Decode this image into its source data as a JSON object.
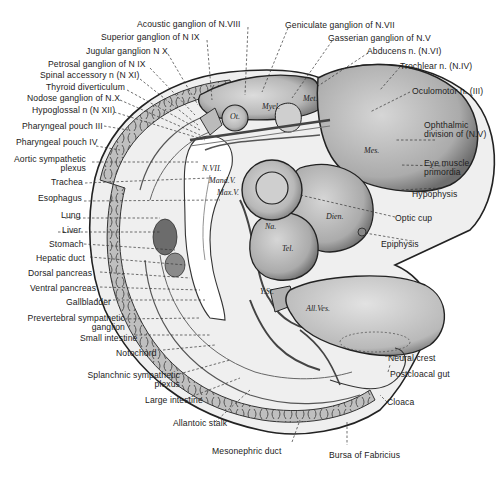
{
  "figure": {
    "colors": {
      "background": "#ffffff",
      "ink": "#1a1a1a",
      "tissue_light": "#e4e4e4",
      "tissue_mid": "#bdbdbd",
      "tissue_dark": "#8a8a8a"
    }
  },
  "labels_top": [
    {
      "id": "acoustic",
      "text": "Acoustic ganglion of N.VIII"
    },
    {
      "id": "superior",
      "text": "Superior ganglion of N IX"
    },
    {
      "id": "jugular",
      "text": "Jugular ganglion N X"
    },
    {
      "id": "geniculate",
      "text": "Geniculate ganglion of N.VII"
    },
    {
      "id": "gasserian",
      "text": "Gasserian ganglion of N.V"
    },
    {
      "id": "abducens",
      "text": "Abducens n. (N.VI)"
    },
    {
      "id": "trochlear",
      "text": "Trochlear n. (N.IV)"
    }
  ],
  "labels_left": [
    {
      "id": "petrosal",
      "text": "Petrosal ganglion of N IX"
    },
    {
      "id": "spinal-accessory",
      "text": "Spinal accessory n (N XI)"
    },
    {
      "id": "thyroid",
      "text": "Thyroid diverticulum"
    },
    {
      "id": "nodose",
      "text": "Nodose ganglion of N.X"
    },
    {
      "id": "hypoglossal",
      "text": "Hypoglossal n (N XII)"
    },
    {
      "id": "pharyngeal-3",
      "text": "Pharyngeal pouch III"
    },
    {
      "id": "pharyngeal-4",
      "text": "Pharyngeal pouch IV"
    },
    {
      "id": "aortic-symp",
      "text": "Aortic sympathetic",
      "text2": "plexus"
    },
    {
      "id": "trachea",
      "text": "Trachea"
    },
    {
      "id": "esophagus",
      "text": "Esophagus"
    },
    {
      "id": "lung",
      "text": "Lung"
    },
    {
      "id": "liver",
      "text": "Liver"
    },
    {
      "id": "stomach",
      "text": "Stomach"
    },
    {
      "id": "hepatic-duct",
      "text": "Hepatic duct"
    },
    {
      "id": "dorsal-pancreas",
      "text": "Dorsal pancreas"
    },
    {
      "id": "ventral-pancreas",
      "text": "Ventral pancreas"
    },
    {
      "id": "gallbladder",
      "text": "Gallbladder"
    },
    {
      "id": "prevertebral",
      "text": "Prevertebral sympathetic",
      "text2": "ganglion"
    },
    {
      "id": "small-intestine",
      "text": "Small intestine"
    },
    {
      "id": "notochord",
      "text": "Notochord"
    },
    {
      "id": "splanchnic",
      "text": "Splanchnic sympathetic",
      "text2": "plexus"
    },
    {
      "id": "large-intestine",
      "text": "Large intestine"
    },
    {
      "id": "allantoic-stalk",
      "text": "Allantoic stalk"
    },
    {
      "id": "mesonephric-duct",
      "text": "Mesonephric duct"
    }
  ],
  "labels_right": [
    {
      "id": "oculomotor",
      "text": "Oculomotor n. (III)"
    },
    {
      "id": "ophthalmic",
      "text": "Ophthalmic",
      "text2": "division of (N.V)"
    },
    {
      "id": "eye-muscle",
      "text": "Eye muscle",
      "text2": "primordia"
    },
    {
      "id": "hypophysis",
      "text": "Hypophysis"
    },
    {
      "id": "optic-cup",
      "text": "Optic cup"
    },
    {
      "id": "epiphysis",
      "text": "Epiphysis"
    },
    {
      "id": "neural-crest",
      "text": "Neural crest"
    },
    {
      "id": "postcloacal-gut",
      "text": "Postcloacal gut"
    },
    {
      "id": "cloaca",
      "text": "Cloaca"
    },
    {
      "id": "bursa",
      "text": "Bursa of Fabricius"
    }
  ],
  "inner_labels": {
    "ot": "Ot.",
    "myel": "Myel.",
    "met": "Met.",
    "mes": "Mes.",
    "dien": "Dien.",
    "tel": "Tel.",
    "na": "Na.",
    "n_vii": "N.VII.",
    "mand_v": "Mand.V.",
    "max_v": "Max.V.",
    "y_st": "Y.St.",
    "all_ves": "All.Ves."
  }
}
